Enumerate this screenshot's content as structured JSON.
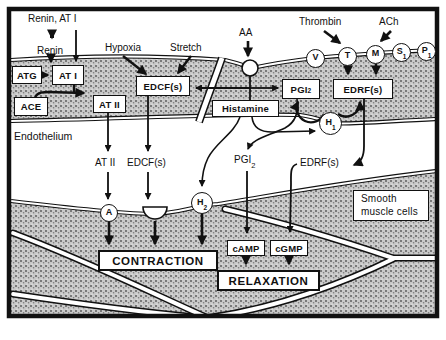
{
  "figure": {
    "colors": {
      "ink": "#111111",
      "paper": "#ffffff",
      "stipple_base": "#c9c9c9",
      "stipple_dot": "#5e5e5e"
    },
    "lumen": {
      "renin_at1": "Renin, AT I",
      "renin": "Renin",
      "hypoxia": "Hypoxia",
      "stretch": "Stretch",
      "aa": "AA",
      "thrombin": "Thrombin",
      "ach": "ACh"
    },
    "endothelium": {
      "label": "Endothelium",
      "boxes": {
        "atg": "ATG",
        "at1": "AT I",
        "ace": "ACE",
        "at2": "AT II",
        "edcf": "EDCF(s)",
        "pgi2": {
          "label": "PGI",
          "sub": "2"
        },
        "edrf": "EDRF(s)",
        "histamine": "Histamine"
      },
      "luminal_receptors": [
        {
          "label": "V",
          "sub": ""
        },
        {
          "label": "T",
          "sub": ""
        },
        {
          "label": "M",
          "sub": ""
        },
        {
          "label": "S",
          "sub": "1"
        },
        {
          "label": "P",
          "sub": "1"
        }
      ],
      "h1_receptor": {
        "label": "H",
        "sub": "1"
      }
    },
    "interstitium": {
      "at2": "AT II",
      "edcf": "EDCF(s)",
      "pgi2": {
        "label": "PGI",
        "sub": "2"
      },
      "edrf": "EDRF(s)"
    },
    "muscle": {
      "label_line1": "Smooth",
      "label_line2": "muscle cells",
      "receptor_a": {
        "label": "A",
        "sub": ""
      },
      "receptor_h2": {
        "label": "H",
        "sub": "2"
      },
      "camp": "cAMP",
      "cgmp": "cGMP",
      "contraction": "CONTRACTION",
      "relaxation": "RELAXATION"
    }
  }
}
